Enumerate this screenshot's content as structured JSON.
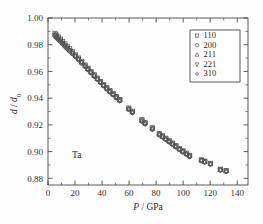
{
  "figure": {
    "material_annotation": "Ta",
    "background_color": "#fefefe",
    "marker_color": "#555555",
    "axis_color": "#4a4a4a"
  },
  "chart_data": {
    "type": "scatter",
    "title": "",
    "subtitle": "",
    "xlabel": "P / GPa",
    "xlabel_parts": {
      "symbol": "P",
      "separator": "/",
      "unit": "GPa"
    },
    "ylabel": "d / d0",
    "ylabel_parts": {
      "symbol": "d",
      "separator": "/",
      "reference": "d",
      "subscript": "0"
    },
    "annotation": "Ta",
    "xlim": [
      0,
      148
    ],
    "ylim": [
      0.875,
      1.0
    ],
    "xticks": [
      0,
      20,
      40,
      60,
      80,
      100,
      120,
      140
    ],
    "xticklabels": [
      "0",
      "20",
      "40",
      "60",
      "80",
      "100",
      "120",
      "140"
    ],
    "xminorticks": [
      10,
      30,
      50,
      70,
      90,
      110,
      130
    ],
    "yticks": [
      0.88,
      0.9,
      0.92,
      0.94,
      0.96,
      0.98,
      1.0
    ],
    "yticklabels": [
      "0.88",
      "0.90",
      "0.92",
      "0.94",
      "0.96",
      "0.98",
      "1.00"
    ],
    "yminorticks": [
      0.89,
      0.91,
      0.93,
      0.95,
      0.97,
      0.99
    ],
    "grid": false,
    "legend_position": "upper right",
    "series": [
      {
        "name": "110",
        "marker": "square",
        "x": [
          5.2,
          6.4,
          7.6,
          9.1,
          10.8,
          12.5,
          14.2,
          16.0,
          18.1,
          20.4,
          22.6,
          24.9,
          27.4,
          29.6,
          31.8,
          34.2,
          36.5,
          38.8,
          41.2,
          43.5,
          45.8,
          48.2,
          50.6,
          53.1,
          59.8,
          62.4,
          69.5,
          71.8,
          77.2,
          82.4,
          84.8,
          87.2,
          89.6,
          92.0,
          94.6,
          97.2,
          99.8,
          102.5,
          104.8,
          113.5,
          116.0,
          120.2,
          127.5,
          131.8
        ],
        "y": [
          0.9885,
          0.9872,
          0.9858,
          0.9842,
          0.9824,
          0.9806,
          0.9788,
          0.977,
          0.9748,
          0.9724,
          0.97,
          0.9676,
          0.9648,
          0.9624,
          0.96,
          0.9575,
          0.955,
          0.9525,
          0.95,
          0.9478,
          0.9456,
          0.9434,
          0.9412,
          0.939,
          0.9326,
          0.9302,
          0.9238,
          0.9218,
          0.9178,
          0.9134,
          0.9118,
          0.91,
          0.9082,
          0.9064,
          0.9044,
          0.9024,
          0.9006,
          0.8988,
          0.8972,
          0.8938,
          0.8928,
          0.8912,
          0.8868,
          0.8858
        ]
      },
      {
        "name": "200",
        "marker": "circle",
        "x": [
          5.2,
          6.4,
          7.6,
          9.1,
          10.8,
          12.5,
          14.2,
          16.0,
          18.1,
          20.4,
          22.6,
          24.9,
          27.4,
          29.6,
          31.8,
          34.2,
          36.5,
          38.8,
          41.2,
          43.5,
          45.8,
          48.2,
          50.6,
          53.1,
          59.8,
          62.4,
          69.5,
          71.8,
          77.2,
          82.4,
          84.8,
          87.2,
          89.6,
          92.0,
          94.6,
          97.2,
          99.8,
          102.5,
          104.8,
          113.5,
          116.0,
          120.2,
          127.5,
          131.8
        ],
        "y": [
          0.9866,
          0.9854,
          0.984,
          0.9826,
          0.9808,
          0.979,
          0.9772,
          0.9754,
          0.9734,
          0.9712,
          0.9688,
          0.9664,
          0.9638,
          0.9614,
          0.959,
          0.9566,
          0.9542,
          0.9518,
          0.9494,
          0.947,
          0.9448,
          0.9426,
          0.9404,
          0.9382,
          0.9316,
          0.9292,
          0.9228,
          0.9208,
          0.9168,
          0.9126,
          0.911,
          0.9092,
          0.9074,
          0.9056,
          0.9036,
          0.9016,
          0.8998,
          0.898,
          0.8964,
          0.8932,
          0.8922,
          0.8906,
          0.8862,
          0.8852
        ]
      },
      {
        "name": "211",
        "marker": "triangle-up",
        "x": [
          5.2,
          6.4,
          7.6,
          9.1,
          10.8,
          12.5,
          14.2,
          16.0,
          18.1,
          20.4,
          22.6,
          24.9,
          27.4,
          29.6,
          31.8,
          34.2,
          36.5,
          38.8,
          41.2,
          43.5,
          45.8,
          48.2,
          50.6,
          53.1,
          59.8,
          62.4,
          69.5,
          71.8,
          77.2,
          82.4,
          84.8,
          87.2,
          89.6,
          92.0,
          94.6,
          97.2,
          99.8,
          102.5,
          104.8,
          113.5,
          116.0,
          120.2,
          127.5,
          131.8
        ],
        "y": [
          0.9878,
          0.9864,
          0.985,
          0.9834,
          0.9816,
          0.9798,
          0.978,
          0.9762,
          0.9742,
          0.9718,
          0.9694,
          0.967,
          0.9644,
          0.962,
          0.9596,
          0.957,
          0.9546,
          0.9522,
          0.9498,
          0.9474,
          0.9452,
          0.943,
          0.9408,
          0.9386,
          0.9322,
          0.9298,
          0.9234,
          0.9214,
          0.9174,
          0.913,
          0.9114,
          0.9096,
          0.9078,
          0.906,
          0.904,
          0.902,
          0.9002,
          0.8984,
          0.8968,
          0.8936,
          0.8926,
          0.891,
          0.8866,
          0.8856
        ]
      },
      {
        "name": "221",
        "marker": "triangle-down",
        "x": [
          5.2,
          6.4,
          7.6,
          9.1,
          10.8,
          12.5,
          14.2,
          16.0,
          18.1,
          20.4,
          22.6,
          24.9,
          27.4,
          29.6,
          31.8,
          34.2,
          36.5,
          38.8,
          41.2,
          43.5,
          45.8,
          48.2,
          50.6,
          53.1,
          59.8,
          62.4,
          69.5,
          71.8,
          77.2,
          82.4,
          84.8,
          87.2,
          89.6,
          92.0,
          94.6,
          97.2,
          99.8,
          102.5,
          104.8,
          113.5,
          116.0,
          120.2,
          127.5,
          131.8
        ],
        "y": [
          0.9872,
          0.9858,
          0.9844,
          0.983,
          0.9812,
          0.9794,
          0.9776,
          0.9758,
          0.9738,
          0.9716,
          0.9692,
          0.9668,
          0.9642,
          0.9618,
          0.9594,
          0.9568,
          0.9544,
          0.952,
          0.9496,
          0.9472,
          0.945,
          0.9428,
          0.9406,
          0.9384,
          0.932,
          0.9296,
          0.9232,
          0.9212,
          0.9172,
          0.9128,
          0.9112,
          0.9094,
          0.9076,
          0.9058,
          0.9038,
          0.9018,
          0.9,
          0.8982,
          0.8966,
          0.8934,
          0.8924,
          0.8908,
          0.8864,
          0.8854
        ]
      },
      {
        "name": "310",
        "marker": "circle-small",
        "x": [
          5.2,
          6.4,
          7.6,
          9.1,
          10.8,
          12.5,
          14.2,
          16.0,
          18.1,
          20.4,
          22.6,
          24.9,
          27.4,
          29.6,
          31.8,
          34.2,
          36.5,
          38.8,
          41.2,
          43.5,
          45.8,
          48.2,
          50.6,
          53.1,
          59.8,
          62.4,
          69.5,
          71.8,
          77.2,
          82.4,
          84.8,
          87.2,
          89.6,
          92.0,
          94.6,
          97.2,
          99.8,
          102.5,
          104.8,
          113.5,
          116.0,
          120.2,
          127.5,
          131.8
        ],
        "y": [
          0.986,
          0.9848,
          0.9836,
          0.9822,
          0.9804,
          0.9786,
          0.9768,
          0.975,
          0.973,
          0.9708,
          0.9684,
          0.966,
          0.9634,
          0.961,
          0.9586,
          0.9562,
          0.9538,
          0.9514,
          0.949,
          0.9466,
          0.9444,
          0.9422,
          0.94,
          0.9378,
          0.9312,
          0.9288,
          0.9224,
          0.9204,
          0.9164,
          0.9122,
          0.9106,
          0.9088,
          0.907,
          0.9052,
          0.9032,
          0.9012,
          0.8994,
          0.8976,
          0.896,
          0.893,
          0.892,
          0.8904,
          0.886,
          0.885
        ]
      }
    ],
    "legend": [
      {
        "label": "110",
        "marker": "square"
      },
      {
        "label": "200",
        "marker": "circle"
      },
      {
        "label": "211",
        "marker": "triangle-up"
      },
      {
        "label": "221",
        "marker": "triangle-down"
      },
      {
        "label": "310",
        "marker": "circle-small"
      }
    ]
  }
}
